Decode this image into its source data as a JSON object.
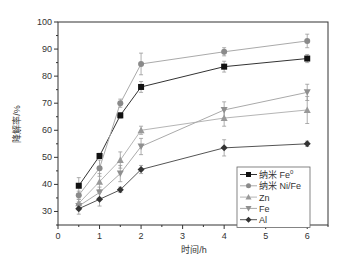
{
  "chart_data": {
    "type": "line",
    "title": "",
    "xlabel": "时间/h",
    "ylabel": "降解率/%",
    "xlim": [
      0,
      6.5
    ],
    "ylim": [
      25,
      100
    ],
    "xticks": [
      0,
      1,
      2,
      3,
      4,
      5,
      6
    ],
    "yticks": [
      30,
      40,
      50,
      60,
      70,
      80,
      90,
      100
    ],
    "grid": false,
    "legend_position": "lower right",
    "x": [
      0.5,
      1,
      1.5,
      2,
      4,
      6
    ],
    "series": [
      {
        "name": "纳米 Fe0",
        "label_main": "纳米 Fe",
        "label_sup": "0",
        "marker": "square",
        "color": "#111111",
        "line": "#333333",
        "values": [
          39.5,
          50.5,
          65.5,
          76,
          83.5,
          86.5
        ],
        "err": [
          3,
          1,
          1,
          2,
          2,
          1.5
        ]
      },
      {
        "name": "纳米 Ni/Fe",
        "label_main": "纳米 Ni/Fe",
        "label_sup": "",
        "marker": "circle",
        "color": "#8a8a8a",
        "line": "#aaaaaa",
        "values": [
          36,
          46,
          70,
          84.5,
          89,
          93
        ],
        "err": [
          1.5,
          3,
          1.5,
          4,
          1.5,
          2.5
        ]
      },
      {
        "name": "Zn",
        "label_main": "Zn",
        "label_sup": "",
        "marker": "triangle-up",
        "color": "#999999",
        "line": "#b5b5b5",
        "values": [
          33,
          41,
          49,
          60,
          64.5,
          67.5
        ],
        "err": [
          1.5,
          3,
          3,
          1.5,
          3,
          5
        ]
      },
      {
        "name": "Fe",
        "label_main": "Fe",
        "label_sup": "",
        "marker": "triangle-down",
        "color": "#8f8f8f",
        "line": "#aaaaaa",
        "values": [
          32,
          37,
          44,
          54,
          67.5,
          74
        ],
        "err": [
          1.5,
          2,
          3,
          3,
          3,
          3
        ]
      },
      {
        "name": "Al",
        "label_main": "Al",
        "label_sup": "",
        "marker": "diamond",
        "color": "#333333",
        "line": "#555555",
        "values": [
          31,
          34.5,
          38,
          45.5,
          53.5,
          55
        ],
        "err": [
          2,
          2.5,
          1,
          1.5,
          3,
          1
        ]
      }
    ]
  }
}
